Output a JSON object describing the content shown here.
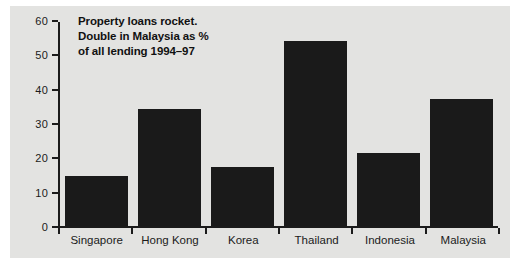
{
  "chart_data": {
    "type": "bar",
    "title": "Property loans rocket. Double in Malaysia as % of all lending 1994–97",
    "title_lines": [
      "Property loans rocket.",
      "Double in Malaysia as %",
      "of all lending 1994–97"
    ],
    "categories": [
      "Singapore",
      "Hong Kong",
      "Korea",
      "Thailand",
      "Indonesia",
      "Malaysia"
    ],
    "values": [
      14.8,
      34.5,
      17.5,
      54.5,
      21.5,
      37.5
    ],
    "xlabel": "",
    "ylabel": "",
    "ylim": [
      0,
      60
    ],
    "yticks": [
      0,
      10,
      20,
      30,
      40,
      50,
      60
    ],
    "ytick_labels": [
      "0",
      "10",
      "20",
      "30",
      "40",
      "50",
      "60"
    ],
    "grid": false,
    "legend": false,
    "bar_color": "#1a1a1a",
    "panel_color": "#e3e3e1",
    "axis_color": "#1b1b1b"
  }
}
